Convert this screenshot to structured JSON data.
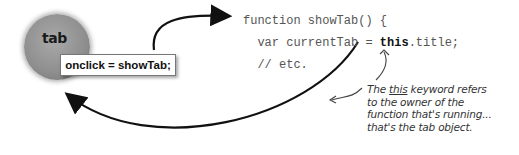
{
  "diagram": {
    "tab_object": {
      "label": "tab",
      "handler": "onclick = showTab;"
    },
    "code": {
      "line1": "function showTab() {",
      "line2_prefix": "  var currentTab = ",
      "line2_keyword": "this",
      "line2_suffix": ".title;",
      "line3": "  // etc."
    },
    "annotation": {
      "line1_pre": "The ",
      "line1_keyword": "this",
      "line1_post": " keyword refers",
      "line2": "to the owner of the",
      "line3": "function that's running...",
      "line4": "that's the tab object."
    },
    "colors": {
      "circle": "#8e8e8e",
      "arrow": "#111111",
      "code_text": "#555555"
    }
  }
}
